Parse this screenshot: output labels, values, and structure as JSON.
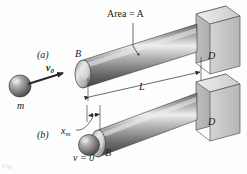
{
  "figure": {
    "type": "mechanics-impact-loading-diagram",
    "background_color": "#fdfdfd",
    "ink_color": "#1a1a1a",
    "caption": "Fig.",
    "labels": {
      "area": "Area = A",
      "part_a": "(a)",
      "part_b": "(b)",
      "velocity_initial": "v",
      "velocity_initial_sub": "0",
      "mass": "m",
      "rod_end_top": "B",
      "rod_end_bottom": "B",
      "support_top": "D",
      "support_bottom": "D",
      "length": "L",
      "deflection": "x",
      "deflection_sub": "m",
      "velocity_zero": "v = 0"
    }
  },
  "geometry": {
    "rod_top": {
      "x1": 82,
      "y1": 72,
      "x2": 196,
      "y2": 33,
      "radius": 13
    },
    "rod_bottom": {
      "x1": 96,
      "y1": 140,
      "x2": 196,
      "y2": 100,
      "radius": 12
    },
    "ball": {
      "cx": 20,
      "cy": 86,
      "r": 11
    },
    "arrow_v0": {
      "x1": 28,
      "y1": 83,
      "x2": 66,
      "y2": 72
    },
    "dimension_L": {
      "x_left": 88,
      "x_right": 200,
      "y": 95
    },
    "dimension_xm": {
      "x_left": 86,
      "x_right": 100,
      "y": 115
    }
  },
  "colors": {
    "rod_light": "#e8e8e8",
    "rod_mid": "#9a9a9a",
    "rod_dark": "#4a4a4a",
    "block_face": "#c9c9c9",
    "block_top": "#e3e3e3",
    "block_side": "#a8a8a8",
    "ball_light": "#dcdcdc",
    "ball_dark": "#5a5a5a",
    "line": "#2a2a2a"
  }
}
